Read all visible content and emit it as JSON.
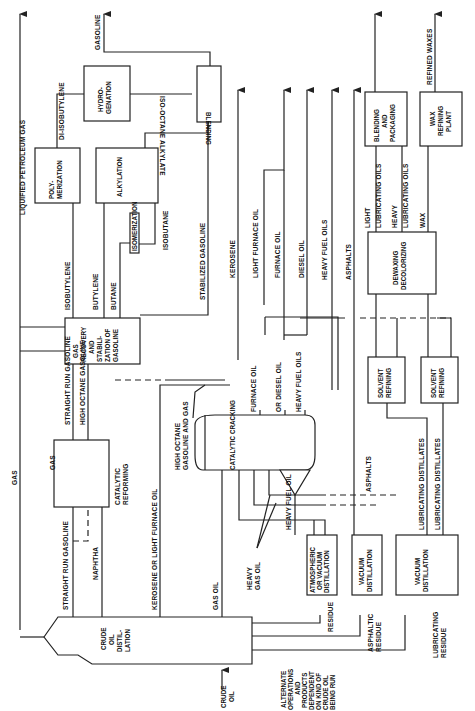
{
  "diagram": {
    "orientation": "rotated 90 degrees counter-clockwise",
    "units": {
      "crude": [
        "CRUDE",
        "OIL",
        "DISTIL-",
        "LATION"
      ],
      "catalytic_reforming": [
        "CATALYTIC",
        "REFORMING"
      ],
      "gas_recovery": [
        "GAS",
        "RECOVERY",
        "AND",
        "STABILI-",
        "ZATION OF",
        "GASOLINE"
      ],
      "polymerization": [
        "POLY-",
        "MERIZATION"
      ],
      "alkylation": "ALKYLATION",
      "isomerization": "ISOMERIZATION",
      "hydrogenation": [
        "HYDRO-",
        "GENATION"
      ],
      "blending": "BLENDING",
      "catalytic_cracking": "CATALYTIC CRACKING",
      "atmospheric": [
        "ATMOSPHERIC",
        "OR VACUUM",
        "DISTILLATION"
      ],
      "vacuum1": [
        "VACUUM",
        "DISTILLATION"
      ],
      "vacuum2": [
        "VACUUM",
        "DISTILLATION"
      ],
      "solvent1": [
        "SOLVENT",
        "REFINING"
      ],
      "solvent2": [
        "SOLVENT",
        "REFINING"
      ],
      "dewaxing": [
        "DEWAXING",
        "DECOLORIZING"
      ],
      "blending_packaging": [
        "BLENDING",
        "AND",
        "PACKAGING"
      ],
      "wax_plant": [
        "WAX",
        "REFINING",
        "PLANT"
      ]
    },
    "streams": {
      "crude_oil": [
        "CRUDE",
        "OIL"
      ],
      "gas": "GAS",
      "lpg": "LIQUIFIED PETROLEUM GAS",
      "gasoline": "GASOLINE",
      "di_isobutylene": "DI-ISOBUTYLENE",
      "iso_octane": "ISO-OCTANE",
      "alkylate": "ALKYLATE",
      "isobutylene": "ISOBUTYLENE",
      "butylene": "BUTYLENE",
      "butane": "BUTANE",
      "isobutane": "ISOBUTANE",
      "stabilized_gasoline": "STABILIZED GASOLINE",
      "kerosene": "KEROSENE",
      "light_furnace_oil": "LIGHT FURNACE OIL",
      "furnace_oil": "FURNACE OIL",
      "diesel_oil": "DIESEL OIL",
      "heavy_fuel_oils": "HEAVY FUEL OILS",
      "asphalts": "ASPHALTS",
      "straight_run_gasoline": "STRAIGHT RUN GASOLINE",
      "high_octane_gasoline": "HIGH OCTANE GASOLINE",
      "gas_small": "GAS",
      "naphtha": "NAPHTHA",
      "kerosene_or_lfo": "KEROSENE OR LIGHT FURNACE OIL",
      "gas_oil": "GAS OIL",
      "high_octane_gas": [
        "HIGH OCTANE",
        "GASOLINE AND GAS"
      ],
      "cc_furnace_oil": "FURNACE OIL",
      "cc_furnace_or_diesel": "OR DIESEL OIL",
      "cc_heavy_fuel_oils": "HEAVY FUEL OILS",
      "heavy_fuel_oil": "HEAVY FUEL OIL",
      "heavy_gas_oil": [
        "HEAVY",
        "GAS OIL"
      ],
      "asphalts_lower": "ASPHALTS",
      "lub_dist_1": "LUBRICATING DISTILLATES",
      "lub_dist_2": "LUBRICATING DISTILLATES",
      "residue": "RESIDUE",
      "asphaltic_residue": [
        "ASPHALTIC",
        "RESIDUE"
      ],
      "lubricating_residue": [
        "LUBRICATING",
        "RESIDUE"
      ],
      "light": "LIGHT",
      "lub_oils_1": "LUBRICATING OILS",
      "heavy": "HEAVY",
      "lub_oils_2": "LUBRICATING OILS",
      "wax": "WAX",
      "refined_waxes": "REFINED WAXES",
      "alternate": [
        "ALTERNATE",
        "OPERATIONS",
        "AND",
        "PRODUCTS",
        "DEPENDENT",
        "ON KIND OF",
        "CRUDE OIL",
        "BEING RUN"
      ]
    }
  }
}
